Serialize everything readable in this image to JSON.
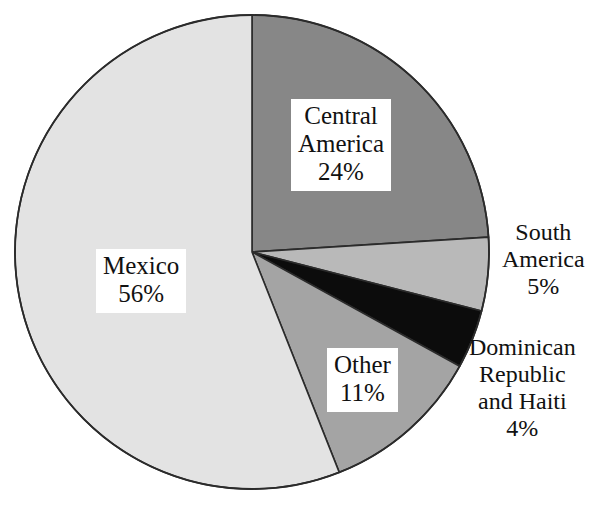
{
  "chart_data": {
    "type": "pie",
    "title": "",
    "subtitle": "",
    "xlabel": "",
    "ylabel": "",
    "legend_position": "none",
    "grid": false,
    "units": "percent",
    "start_angle_deg": 0,
    "direction": "clockwise",
    "categories": [
      "Central America",
      "South America",
      "Dominican Republic and Haiti",
      "Other",
      "Mexico"
    ],
    "values": [
      24,
      5,
      4,
      11,
      56
    ],
    "slices": [
      {
        "id": "central-america",
        "name": "Central America",
        "value": 24,
        "value_label": "24%",
        "color": "#878787",
        "label_lines": [
          "Central America",
          "24%"
        ],
        "label_style": "boxed-inside"
      },
      {
        "id": "south-america",
        "name": "South America",
        "value": 5,
        "value_label": "5%",
        "color": "#b9b9b9",
        "label_lines": [
          "South America",
          "5%"
        ],
        "label_style": "outside"
      },
      {
        "id": "dominican-republic-and-haiti",
        "name": "Dominican Republic and Haiti",
        "value": 4,
        "value_label": "4%",
        "color": "#0c0c0c",
        "label_lines": [
          "Dominican Republic and Haiti",
          "4%"
        ],
        "label_style": "outside"
      },
      {
        "id": "other",
        "name": "Other",
        "value": 11,
        "value_label": "11%",
        "color": "#a4a4a4",
        "label_lines": [
          "Other",
          "11%"
        ],
        "label_style": "boxed-inside"
      },
      {
        "id": "mexico",
        "name": "Mexico",
        "value": 56,
        "value_label": "56%",
        "color": "#e3e3e3",
        "label_lines": [
          "Mexico",
          "56%"
        ],
        "label_style": "boxed-inside"
      }
    ],
    "outline_color": "#2b2b2b",
    "background_color": "#ffffff"
  },
  "labels": {
    "central_america": {
      "line1": "Central",
      "line2": "America",
      "line3": "24%"
    },
    "mexico": {
      "line1": "Mexico",
      "line2": "56%"
    },
    "other": {
      "line1": "Other",
      "line2": "11%"
    },
    "south_america": {
      "line1": "South",
      "line2": "America",
      "line3": "5%"
    },
    "dominican": {
      "line1": "Dominican",
      "line2": "Republic",
      "line3": "and Haiti",
      "line4": "4%"
    }
  }
}
